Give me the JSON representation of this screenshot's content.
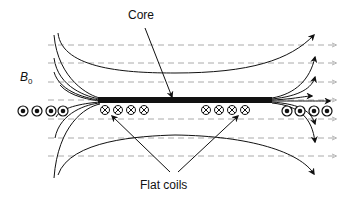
{
  "diagram": {
    "labels": {
      "core": "Core",
      "field": "B",
      "field_subscript": "0",
      "coils": "Flat coils"
    },
    "colors": {
      "field_lines": "#1a1a1a",
      "background_field": "#9a9a9a",
      "core": "#111111"
    },
    "symbols": {
      "current_out": "dot-in-circle",
      "current_in": "cross-in-circle"
    },
    "counts": {
      "left_external_dots": 4,
      "right_external_dots": 4,
      "left_coil_crosses": 4,
      "right_coil_crosses": 4,
      "background_dashed_lines": 7
    }
  }
}
